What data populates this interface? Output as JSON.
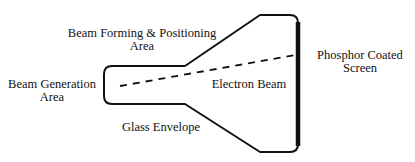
{
  "diagram": {
    "labels": {
      "beam_forming_line1": "Beam Forming & Positioning",
      "beam_forming_line2": "Area",
      "beam_generation_line1": "Beam Generation",
      "beam_generation_line2": "Area",
      "electron_beam": "Electron Beam",
      "phosphor_line1": "Phosphor Coated",
      "phosphor_line2": "Screen",
      "glass_envelope": "Glass Envelope"
    },
    "colors": {
      "stroke": "#111111",
      "background": "#ffffff"
    }
  }
}
